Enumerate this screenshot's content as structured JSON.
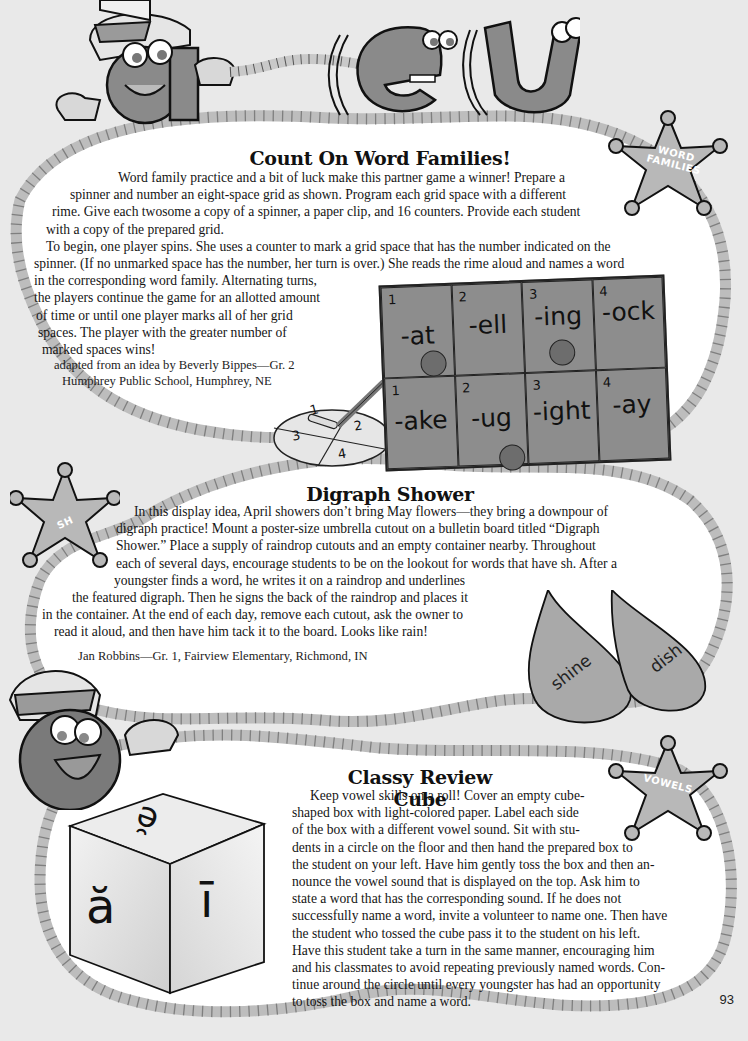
{
  "page_number": "93",
  "header_art": {
    "letters": [
      "a",
      "e",
      "u"
    ]
  },
  "sections": [
    {
      "title": "Count On Word Families!",
      "badge": "WORD FAMILIES",
      "badge_lines": [
        "WORD",
        "FAMILIES"
      ],
      "paragraph_lines": [
        "Word family practice and a bit of luck make this partner game a winner! Prepare a",
        "spinner and number an eight-space grid as shown. Program each grid space with a different",
        "rime. Give each twosome a copy of a spinner, a paper clip, and 16 counters. Provide each student",
        "with a copy of the prepared grid.",
        "To begin, one player spins. She uses a counter to mark a grid space that has the number indicated on the",
        "spinner. (If no unmarked space has the number, her turn is over.) She reads the rime aloud and names a word",
        "in the corresponding word family. Alternating turns,",
        "the players continue the game for an allotted amount",
        "of time or until one player marks all of her grid",
        "spaces. The player with the greater number of",
        "marked spaces wins!"
      ],
      "credit_lines": [
        "adapted from an idea by Beverly Bippes—Gr. 2",
        "Humphrey Public School, Humphrey, NE"
      ],
      "spinner": {
        "sections": [
          "1",
          "2",
          "3",
          "4"
        ]
      },
      "grid": {
        "rows": [
          [
            {
              "num": "1",
              "rime": "-at",
              "marked": true
            },
            {
              "num": "2",
              "rime": "-ell",
              "marked": false
            },
            {
              "num": "3",
              "rime": "-ing",
              "marked": true
            },
            {
              "num": "4",
              "rime": "-ock",
              "marked": false
            }
          ],
          [
            {
              "num": "1",
              "rime": "-ake",
              "marked": false
            },
            {
              "num": "2",
              "rime": "-ug",
              "marked": true
            },
            {
              "num": "3",
              "rime": "-ight",
              "marked": false
            },
            {
              "num": "4",
              "rime": "-ay",
              "marked": false
            }
          ]
        ]
      }
    },
    {
      "title": "Digraph Shower",
      "badge": "SH",
      "paragraph_lines": [
        "In this display idea, April showers don’t bring May flowers—they bring a downpour of",
        "digraph practice! Mount a poster-size umbrella cutout on a bulletin board titled “Digraph",
        "Shower.” Place a supply of raindrop cutouts and an empty container nearby. Throughout",
        "each of several days, encourage students to be on the lookout for words that have sh. After a",
        "youngster finds a word, he writes it on a raindrop and underlines",
        "the featured digraph. Then he signs the back of the raindrop and places it",
        "in the container. At the end of each day, remove each cutout, ask the owner to",
        "read it aloud, and then have him tack it to the board. Looks like rain!"
      ],
      "credit": "Jan Robbins—Gr. 1, Fairview Elementary, Richmond, IN",
      "raindrops": [
        {
          "word": "shine",
          "underlined": "sh"
        },
        {
          "word": "dish",
          "underlined": "sh"
        }
      ]
    },
    {
      "title": "Classy Review Cube",
      "badge": "VOWELS",
      "paragraph_lines": [
        "Keep vowel skills on a roll! Cover an empty cube-",
        "shaped box with light-colored paper. Label each side",
        "of the box with a different vowel sound. Sit with stu-",
        "dents in a circle on the floor and then hand the prepared box to",
        "the student on your left. Have him gently toss the box and then an-",
        "nounce the vowel sound that is displayed on the top. Ask him to",
        "state a word that has the corresponding sound. If he does not",
        "successfully name a word, invite a volunteer to name one. Then have",
        "the student who tossed the cube pass it to the student on his left.",
        "Have this student take a turn in the same manner, encouraging him",
        "and his classmates to avoid repeating previously named words. Con-",
        "tinue around the circle until every youngster has had an opportunity",
        "to toss the box and name a word."
      ],
      "cube_faces": {
        "top": "ĕ",
        "left": "ă",
        "right": "ī"
      }
    }
  ],
  "colors": {
    "background": "#e9e9e9",
    "panel": "#ffffff",
    "rope": "#c9c9c9",
    "badge": "#b8b8b8",
    "grid": "#8d8d8d",
    "raindrop": "#a9a9a9",
    "character": "#777777"
  }
}
